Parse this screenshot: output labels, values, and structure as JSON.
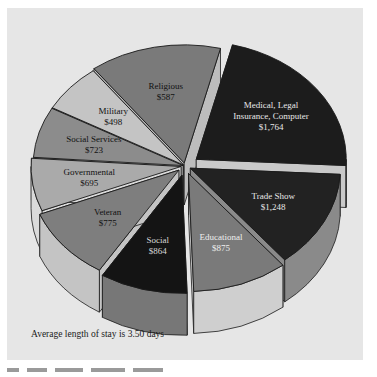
{
  "chart_data": {
    "type": "pie",
    "style": "3d-exploded",
    "title": "",
    "unit": "$",
    "categories": [
      "Medical, Legal Insurance, Computer",
      "Trade Show",
      "Educational",
      "Social",
      "Veteran",
      "Governmental",
      "Social Services",
      "Military",
      "Religious"
    ],
    "values": [
      1764,
      1248,
      875,
      864,
      775,
      695,
      723,
      498,
      587
    ],
    "slices": [
      {
        "label_lines": [
          "Medical, Legal",
          "Insurance, Computer",
          "$1,764"
        ],
        "value": 1764,
        "top": "#1c1c1c",
        "side": "#c9c9c9",
        "text": "#e8e8e8",
        "start": -76,
        "end": 3,
        "explode": 14
      },
      {
        "label_lines": [
          "Trade Show",
          "$1,248"
        ],
        "value": 1248,
        "top": "#222222",
        "side": "#8a8a8a",
        "text": "#e8e8e8",
        "start": 3,
        "end": 51,
        "explode": 6
      },
      {
        "label_lines": [
          "Educational",
          "$875"
        ],
        "value": 875,
        "top": "#7a7a7a",
        "side": "#cfcfcf",
        "text": "#efefef",
        "start": 51,
        "end": 88,
        "explode": 10
      },
      {
        "label_lines": [
          "Social",
          "$864"
        ],
        "value": 864,
        "top": "#141414",
        "side": "#777777",
        "text": "#d8d8d8",
        "start": 88,
        "end": 122,
        "explode": 12
      },
      {
        "label_lines": [
          "Veteran",
          "$775"
        ],
        "value": 775,
        "top": "#7e7e7e",
        "side": "#c4c4c4",
        "text": "#111111",
        "start": 122,
        "end": 158,
        "explode": 8
      },
      {
        "label_lines": [
          "Governmental",
          "$695"
        ],
        "value": 695,
        "top": "#aaaaaa",
        "side": "#dadada",
        "text": "#111111",
        "start": 158,
        "end": 184,
        "explode": 4
      },
      {
        "label_lines": [
          "Social Services",
          "$723"
        ],
        "value": 723,
        "top": "#8c8c8c",
        "side": "#c0c0c0",
        "text": "#111111",
        "start": 184,
        "end": 209,
        "explode": 2
      },
      {
        "label_lines": [
          "Military",
          "$498"
        ],
        "value": 498,
        "top": "#c4c4c4",
        "side": "#dedede",
        "text": "#111111",
        "start": 209,
        "end": 233,
        "explode": 2
      },
      {
        "label_lines": [
          "Religious",
          "$587"
        ],
        "value": 587,
        "top": "#7a7a7a",
        "side": "#bdbdbd",
        "text": "#111111",
        "start": 233,
        "end": 284,
        "explode": 4
      }
    ],
    "annotation": "Average length of stay is 3.50 days",
    "legend": "none"
  },
  "caption": "Average length of stay is 3.50 days",
  "colors": {
    "panel_bg": "#e6e6e6",
    "page_bg": "#ffffff",
    "outline": "#1a1a1a"
  }
}
